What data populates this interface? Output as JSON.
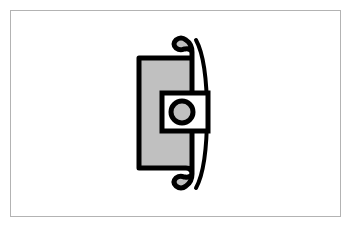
{
  "figure": {
    "title": "Cross-section profile of a mechanical seal / gasket retainer",
    "type": "technical-line-drawing",
    "view": "sectional-side-view",
    "canvas": {
      "width": 351,
      "height": 227,
      "background_color": "#ffffff"
    },
    "frame": {
      "name": "image-border",
      "x": 10,
      "y": 10,
      "width": 331,
      "height": 207,
      "stroke_color": "#b3b3b3",
      "stroke_width": 1,
      "fill_color": "#ffffff"
    },
    "palette": {
      "outline": "#000000",
      "body_fill": "#c0c0c0",
      "void_fill": "#ffffff",
      "frame": "#b3b3b3",
      "background": "#ffffff"
    },
    "parts": [
      {
        "id": "main-body",
        "label": "Main body profile",
        "description": "Vertical rectangular section with symmetric hook / S-curve returns at the top and bottom of its right side",
        "fill_color": "#c0c0c0",
        "stroke_color": "#000000",
        "stroke_width": 5,
        "bounds": {
          "x": 137,
          "y": 33,
          "width": 72,
          "height": 162
        },
        "path": "M 139 58 L 139 168 L 186 168 Q 192 168 192 174 Q 192 182 186 186 Q 181 190 176 186 Q 172 182 176 178 Q 180 175 184 177 L 185 177 Q 190 178 192 174 L 192 52 Q 190 48 185 49 L 184 49 Q 180 51 176 48 Q 172 44 176 40 Q 181 36 186 40 Q 192 44 192 52 L 192 58 Z"
      },
      {
        "id": "outer-crescent",
        "label": "Outer curved lip / crescent",
        "description": "Thin crescent-shaped outline hugging the right flank of the main body, open toward the body",
        "fill_color": "none",
        "stroke_color": "#000000",
        "stroke_width": 4,
        "bounds": {
          "x": 193,
          "y": 36,
          "width": 17,
          "height": 156
        },
        "path": "M 196 40 Q 207 60 207 114 Q 207 168 196 188"
      },
      {
        "id": "center-window",
        "label": "Rectangular through-slot (white void)",
        "description": "Unfilled rectangular opening across the middle of the body, open to the right edge",
        "fill_color": "#ffffff",
        "stroke_color": "#000000",
        "stroke_width": 5,
        "bounds": {
          "x": 162,
          "y": 93,
          "width": 44,
          "height": 38
        }
      },
      {
        "id": "center-bore",
        "label": "Circular bore",
        "description": "Gray-filled circle with heavy black outline centered inside the rectangular slot",
        "fill_color": "#c0c0c0",
        "stroke_color": "#000000",
        "stroke_width": 5,
        "center": {
          "cx": 182,
          "cy": 112
        },
        "radius": 11
      }
    ],
    "symmetry": {
      "axis": "horizontal",
      "axis_y": 112,
      "note": "Top and bottom hook returns are mirror images about the horizontal mid-line"
    }
  }
}
